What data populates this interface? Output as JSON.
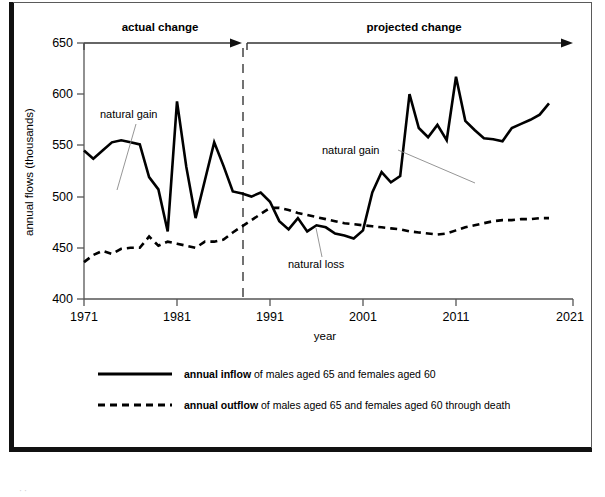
{
  "chart_data": {
    "type": "line",
    "title": "",
    "xlabel": "year",
    "ylabel": "annual flows (thousands)",
    "xlim": [
      1971,
      2021
    ],
    "ylim": [
      400,
      650
    ],
    "y_ticks": [
      400,
      450,
      500,
      550,
      600,
      650
    ],
    "x_ticks": [
      1971,
      1981,
      1991,
      2001,
      2011,
      2021
    ],
    "grid": false,
    "legend_position": "below-plot",
    "x": [
      1971,
      1972,
      1973,
      1974,
      1975,
      1976,
      1977,
      1978,
      1979,
      1980,
      1981,
      1982,
      1983,
      1984,
      1985,
      1986,
      1987,
      1988,
      1989,
      1990,
      1991,
      1992,
      1993,
      1994,
      1995,
      1996,
      1997,
      1998,
      1999,
      2000,
      2001,
      2002,
      2003,
      2004,
      2005,
      2006,
      2007,
      2008,
      2009,
      2010,
      2011,
      2012,
      2013,
      2014,
      2015,
      2016,
      2017,
      2018,
      2019,
      2020,
      2021
    ],
    "series": [
      {
        "name": "annual inflow",
        "style": "solid",
        "color": "#000000",
        "values": [
          545,
          537,
          545,
          553,
          555,
          553,
          551,
          519,
          507,
          466,
          593,
          529,
          479,
          516,
          553,
          530,
          505,
          503,
          500,
          504,
          495,
          476,
          468,
          479,
          466,
          472,
          470,
          464,
          462,
          459,
          467,
          504,
          524,
          514,
          520,
          600,
          567,
          558,
          570,
          555,
          617,
          574,
          565,
          557,
          556,
          554,
          567,
          571,
          575,
          580,
          591
        ]
      },
      {
        "name": "annual outflow",
        "style": "dashed",
        "color": "#000000",
        "values": [
          436,
          443,
          447,
          444,
          449,
          450,
          450,
          461,
          452,
          456,
          454,
          452,
          450,
          456,
          456,
          458,
          465,
          471,
          477,
          483,
          489,
          489,
          487,
          484,
          482,
          480,
          478,
          476,
          474,
          473,
          472,
          471,
          470,
          469,
          468,
          466,
          465,
          464,
          463,
          464,
          467,
          470,
          472,
          474,
          476,
          477,
          477,
          478,
          478,
          479,
          479
        ]
      }
    ],
    "annotations": [
      {
        "id": "natural-gain-actual",
        "text": "natural gain"
      },
      {
        "id": "natural-gain-projected",
        "text": "natural gain"
      },
      {
        "id": "natural-loss",
        "text": "natural loss"
      }
    ],
    "phases": [
      {
        "id": "actual",
        "label": "actual change",
        "from": 1971,
        "to": 1988
      },
      {
        "id": "projected",
        "label": "projected change",
        "from": 1988,
        "to": 2021
      }
    ],
    "divider_year": 1988
  },
  "axes": {
    "y_title": "annual flows (thousands)",
    "x_title": "year",
    "y_ticks": [
      "650",
      "600",
      "550",
      "500",
      "450",
      "400"
    ],
    "x_ticks": [
      "1971",
      "1981",
      "1991",
      "2001",
      "2011",
      "2021"
    ]
  },
  "phases": {
    "actual_label": "actual change",
    "projected_label": "projected change"
  },
  "annotations": {
    "natural_gain_1": "natural gain",
    "natural_gain_2": "natural gain",
    "natural_loss": "natural loss"
  },
  "legend": {
    "items": [
      {
        "id": "annual-inflow",
        "style": "solid",
        "bold_part": "annual inflow",
        "rest": " of males aged 65 and females aged 60"
      },
      {
        "id": "annual-outflow",
        "style": "dashed",
        "bold_part": "annual outflow",
        "rest": " of males aged 65 and females aged 60 through death"
      }
    ]
  },
  "page": {
    "footer_artifact": "ॱॱ"
  },
  "colors": {
    "ink": "#000000",
    "axis": "#555555",
    "frame": "#111111",
    "leader": "#8a8a8a"
  }
}
